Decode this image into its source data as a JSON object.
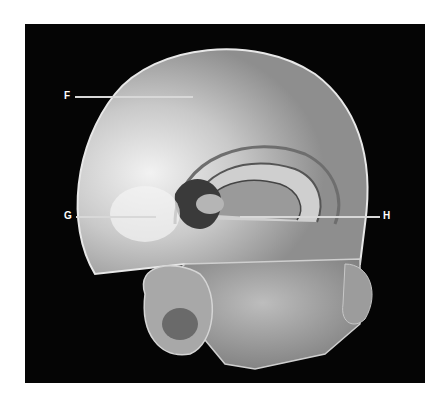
{
  "figure": {
    "background_color": "#050505",
    "labels": [
      {
        "id": "F",
        "text": "F"
      },
      {
        "id": "G",
        "text": "G"
      },
      {
        "id": "H",
        "text": "H"
      }
    ]
  }
}
